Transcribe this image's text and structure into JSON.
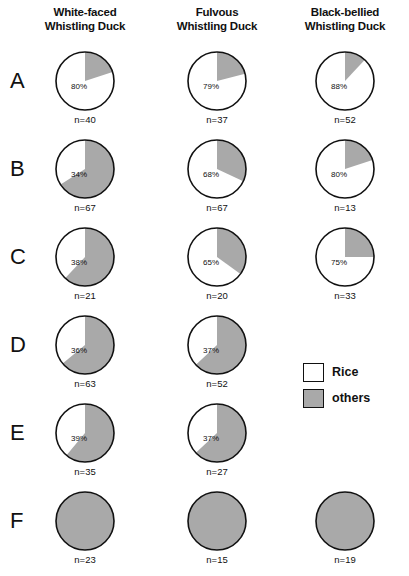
{
  "columns": [
    {
      "line1": "White-faced",
      "line2": "Whistling Duck"
    },
    {
      "line1": "Fulvous",
      "line2": "Whistling Duck"
    },
    {
      "line1": "Black-bellied",
      "line2": "Whistling Duck"
    }
  ],
  "legend": {
    "rice_label": "Rice",
    "others_label": "others",
    "rice_color": "#ffffff",
    "others_color": "#a9a9a9"
  },
  "rows": [
    {
      "letter": "A"
    },
    {
      "letter": "B"
    },
    {
      "letter": "C"
    },
    {
      "letter": "D"
    },
    {
      "letter": "E"
    },
    {
      "letter": "F"
    }
  ],
  "cells": {
    "A0": {
      "pct": "80%",
      "n": "n=40"
    },
    "A1": {
      "pct": "79%",
      "n": "n=37"
    },
    "A2": {
      "pct": "88%",
      "n": "n=52"
    },
    "B0": {
      "pct": "34%",
      "n": "n=67"
    },
    "B1": {
      "pct": "68%",
      "n": "n=67"
    },
    "B2": {
      "pct": "80%",
      "n": "n=13"
    },
    "C0": {
      "pct": "38%",
      "n": "n=21"
    },
    "C1": {
      "pct": "65%",
      "n": "n=20"
    },
    "C2": {
      "pct": "75%",
      "n": "n=33"
    },
    "D0": {
      "pct": "36%",
      "n": "n=63"
    },
    "D1": {
      "pct": "37%",
      "n": "n=52"
    },
    "D2": null,
    "E0": {
      "pct": "39%",
      "n": "n=35"
    },
    "E1": {
      "pct": "37%",
      "n": "n=27"
    },
    "E2": null,
    "F0": {
      "pct": "",
      "n": "n=23"
    },
    "F1": {
      "pct": "",
      "n": "n=15"
    },
    "F2": {
      "pct": "",
      "n": "n=19"
    }
  },
  "chart_data": {
    "type": "pie",
    "title": "",
    "categories": [
      "Rice",
      "others"
    ],
    "colors": [
      "#ffffff",
      "#a9a9a9"
    ],
    "legend_position": "right-middle",
    "row_labels": [
      "A",
      "B",
      "C",
      "D",
      "E",
      "F"
    ],
    "column_labels": [
      "White-faced Whistling Duck",
      "Fulvous Whistling Duck",
      "Black-bellied Whistling Duck"
    ],
    "note": "Each pie shows percent of Rice (white, labeled) vs others (gray). n = sample size.",
    "pies": [
      {
        "row": "A",
        "column": "White-faced Whistling Duck",
        "rice_pct": 80,
        "others_pct": 20,
        "n": 40,
        "label": "80%",
        "n_label": "n=40"
      },
      {
        "row": "A",
        "column": "Fulvous Whistling Duck",
        "rice_pct": 79,
        "others_pct": 21,
        "n": 37,
        "label": "79%",
        "n_label": "n=37"
      },
      {
        "row": "A",
        "column": "Black-bellied Whistling Duck",
        "rice_pct": 88,
        "others_pct": 12,
        "n": 52,
        "label": "88%",
        "n_label": "n=52"
      },
      {
        "row": "B",
        "column": "White-faced Whistling Duck",
        "rice_pct": 34,
        "others_pct": 66,
        "n": 67,
        "label": "34%",
        "n_label": "n=67"
      },
      {
        "row": "B",
        "column": "Fulvous Whistling Duck",
        "rice_pct": 68,
        "others_pct": 32,
        "n": 67,
        "label": "68%",
        "n_label": "n=67"
      },
      {
        "row": "B",
        "column": "Black-bellied Whistling Duck",
        "rice_pct": 80,
        "others_pct": 20,
        "n": 13,
        "label": "80%",
        "n_label": "n=13"
      },
      {
        "row": "C",
        "column": "White-faced Whistling Duck",
        "rice_pct": 38,
        "others_pct": 62,
        "n": 21,
        "label": "38%",
        "n_label": "n=21"
      },
      {
        "row": "C",
        "column": "Fulvous Whistling Duck",
        "rice_pct": 65,
        "others_pct": 35,
        "n": 20,
        "label": "65%",
        "n_label": "n=20"
      },
      {
        "row": "C",
        "column": "Black-bellied Whistling Duck",
        "rice_pct": 75,
        "others_pct": 25,
        "n": 33,
        "label": "75%",
        "n_label": "n=33"
      },
      {
        "row": "D",
        "column": "White-faced Whistling Duck",
        "rice_pct": 36,
        "others_pct": 64,
        "n": 63,
        "label": "36%",
        "n_label": "n=63"
      },
      {
        "row": "D",
        "column": "Fulvous Whistling Duck",
        "rice_pct": 37,
        "others_pct": 63,
        "n": 52,
        "label": "37%",
        "n_label": "n=52"
      },
      {
        "row": "E",
        "column": "White-faced Whistling Duck",
        "rice_pct": 39,
        "others_pct": 61,
        "n": 35,
        "label": "39%",
        "n_label": "n=35"
      },
      {
        "row": "E",
        "column": "Fulvous Whistling Duck",
        "rice_pct": 37,
        "others_pct": 63,
        "n": 27,
        "label": "37%",
        "n_label": "n=27"
      },
      {
        "row": "F",
        "column": "White-faced Whistling Duck",
        "rice_pct": 0,
        "others_pct": 100,
        "n": 23,
        "label": "",
        "n_label": "n=23"
      },
      {
        "row": "F",
        "column": "Fulvous Whistling Duck",
        "rice_pct": 0,
        "others_pct": 100,
        "n": 15,
        "label": "",
        "n_label": "n=15"
      },
      {
        "row": "F",
        "column": "Black-bellied Whistling Duck",
        "rice_pct": 0,
        "others_pct": 100,
        "n": 19,
        "label": "",
        "n_label": "n=19"
      }
    ]
  }
}
